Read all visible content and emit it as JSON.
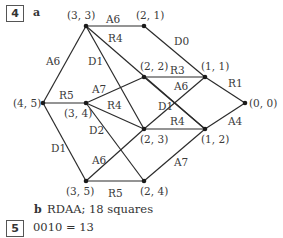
{
  "question4": {
    "number": "4",
    "part_a_label": "a",
    "part_b_label": "b",
    "part_b_text": "RDAA; 18 squares"
  },
  "question5": {
    "number": "5",
    "text": "0010 = 13"
  },
  "graph": {
    "nodes": [
      {
        "id": "n33",
        "label": "(3, 3)",
        "x": 86,
        "y": 26,
        "lx": 67,
        "ly": 19
      },
      {
        "id": "n21",
        "label": "(2, 1)",
        "x": 144,
        "y": 26,
        "lx": 136,
        "ly": 19
      },
      {
        "id": "n22",
        "label": "(2, 2)",
        "x": 144,
        "y": 77,
        "lx": 140,
        "ly": 70
      },
      {
        "id": "n11",
        "label": "(1, 1)",
        "x": 205,
        "y": 77,
        "lx": 201,
        "ly": 70
      },
      {
        "id": "n00",
        "label": "(0, 0)",
        "x": 245,
        "y": 103,
        "lx": 249,
        "ly": 107
      },
      {
        "id": "n45",
        "label": "(4, 5)",
        "x": 43,
        "y": 103,
        "lx": 13,
        "ly": 107
      },
      {
        "id": "n34",
        "label": "(3, 4)",
        "x": 86,
        "y": 103,
        "lx": 64,
        "ly": 117
      },
      {
        "id": "n23",
        "label": "(2, 3)",
        "x": 144,
        "y": 129,
        "lx": 140,
        "ly": 143
      },
      {
        "id": "n12",
        "label": "(1, 2)",
        "x": 205,
        "y": 129,
        "lx": 201,
        "ly": 143
      },
      {
        "id": "n35",
        "label": "(3, 5)",
        "x": 86,
        "y": 181,
        "lx": 66,
        "ly": 195
      },
      {
        "id": "n24",
        "label": "(2, 4)",
        "x": 144,
        "y": 181,
        "lx": 140,
        "ly": 195
      }
    ],
    "edges": [
      {
        "from": "n33",
        "to": "n21",
        "label": "A6",
        "lx": 106,
        "ly": 23
      },
      {
        "from": "n21",
        "to": "n11",
        "label": "D0",
        "lx": 174,
        "ly": 45
      },
      {
        "from": "n33",
        "to": "n45",
        "label": "A6",
        "lx": 46,
        "ly": 65
      },
      {
        "from": "n33",
        "to": "n23",
        "label": "D1",
        "lx": 88,
        "ly": 65
      },
      {
        "from": "n33",
        "to": "n12",
        "label": "R4",
        "lx": 108,
        "ly": 42
      },
      {
        "from": "n45",
        "to": "n34",
        "label": "R5",
        "lx": 59,
        "ly": 99
      },
      {
        "from": "n45",
        "to": "n35",
        "label": "D1",
        "lx": 51,
        "ly": 152
      },
      {
        "from": "n34",
        "to": "n22",
        "label": "A7",
        "lx": 92,
        "ly": 93
      },
      {
        "from": "n34",
        "to": "n23",
        "label": "R4",
        "lx": 107,
        "ly": 109
      },
      {
        "from": "n34",
        "to": "n24",
        "label": "D2",
        "lx": 89,
        "ly": 134
      },
      {
        "from": "n22",
        "to": "n11",
        "label": "R3",
        "lx": 170,
        "ly": 74
      },
      {
        "from": "n22",
        "to": "n12",
        "label": "A6",
        "lx": 174,
        "ly": 90
      },
      {
        "from": "n23",
        "to": "n11",
        "label": "D1",
        "lx": 158,
        "ly": 110
      },
      {
        "from": "n23",
        "to": "n12",
        "label": "R4",
        "lx": 170,
        "ly": 125
      },
      {
        "from": "n11",
        "to": "n00",
        "label": "R1",
        "lx": 228,
        "ly": 87
      },
      {
        "from": "n12",
        "to": "n00",
        "label": "A4",
        "lx": 228,
        "ly": 125
      },
      {
        "from": "n35",
        "to": "n24",
        "label": "R5",
        "lx": 108,
        "ly": 197
      },
      {
        "from": "n35",
        "to": "n23",
        "label": "A6",
        "lx": 92,
        "ly": 164
      },
      {
        "from": "n24",
        "to": "n12",
        "label": "A7",
        "lx": 174,
        "ly": 166
      }
    ]
  }
}
